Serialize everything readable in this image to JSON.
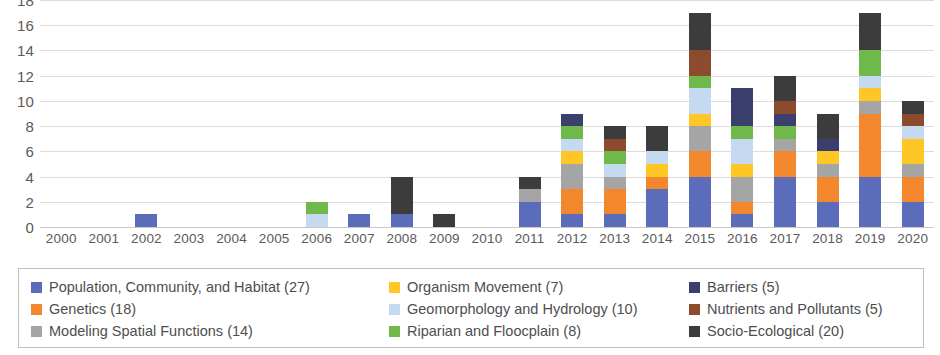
{
  "chart_data": {
    "type": "bar",
    "stacked": true,
    "title": "",
    "xlabel": "",
    "ylabel": "",
    "ylim": [
      0,
      18
    ],
    "ytick_step": 2,
    "yticks": [
      18,
      16,
      14,
      12,
      10,
      8,
      6,
      4,
      2,
      0
    ],
    "grid": true,
    "legend_position": "bottom",
    "categories": [
      "2000",
      "2001",
      "2002",
      "2003",
      "2004",
      "2005",
      "2006",
      "2007",
      "2008",
      "2009",
      "2010",
      "2011",
      "2012",
      "2013",
      "2014",
      "2015",
      "2016",
      "2017",
      "2018",
      "2019",
      "2020"
    ],
    "series": [
      {
        "name": "Population, Community, and Habitat",
        "total": 27,
        "color": "#5b6dba",
        "values": [
          0,
          0,
          1,
          0,
          0,
          0,
          0,
          1,
          1,
          0,
          0,
          2,
          1,
          1,
          3,
          4,
          1,
          4,
          2,
          4,
          2
        ]
      },
      {
        "name": "Genetics",
        "total": 18,
        "color": "#f2872e",
        "values": [
          0,
          0,
          0,
          0,
          0,
          0,
          0,
          0,
          0,
          0,
          0,
          0,
          2,
          2,
          1,
          2,
          1,
          2,
          2,
          5,
          2
        ]
      },
      {
        "name": "Modeling Spatial Functions",
        "total": 14,
        "color": "#a5a5a5",
        "values": [
          0,
          0,
          0,
          0,
          0,
          0,
          0,
          0,
          0,
          0,
          0,
          1,
          2,
          1,
          0,
          2,
          2,
          1,
          1,
          1,
          1
        ]
      },
      {
        "name": "Organism Movement",
        "total": 7,
        "color": "#ffc726",
        "values": [
          0,
          0,
          0,
          0,
          0,
          0,
          0,
          0,
          0,
          0,
          0,
          0,
          1,
          0,
          1,
          1,
          1,
          0,
          1,
          1,
          2
        ]
      },
      {
        "name": "Geomorphology and Hydrology",
        "total": 10,
        "color": "#c5d9f1",
        "values": [
          0,
          0,
          0,
          0,
          0,
          0,
          1,
          0,
          0,
          0,
          0,
          0,
          1,
          1,
          1,
          2,
          2,
          0,
          0,
          1,
          1
        ]
      },
      {
        "name": "Riparian and Floocplain",
        "total": 8,
        "color": "#6eb94a",
        "values": [
          0,
          0,
          0,
          0,
          0,
          0,
          1,
          0,
          0,
          0,
          0,
          0,
          1,
          1,
          0,
          1,
          1,
          1,
          0,
          2,
          0
        ]
      },
      {
        "name": "Barriers",
        "total": 5,
        "color": "#3b3f6e",
        "values": [
          0,
          0,
          0,
          0,
          0,
          0,
          0,
          0,
          0,
          0,
          0,
          0,
          1,
          0,
          0,
          0,
          3,
          1,
          1,
          0,
          0
        ]
      },
      {
        "name": "Nutrients and Pollutants",
        "total": 5,
        "color": "#8c4b2c",
        "values": [
          0,
          0,
          0,
          0,
          0,
          0,
          0,
          0,
          0,
          0,
          0,
          0,
          0,
          1,
          0,
          2,
          0,
          1,
          0,
          0,
          1
        ]
      },
      {
        "name": "Socio-Ecological",
        "total": 20,
        "color": "#3c3c3c",
        "values": [
          0,
          0,
          0,
          0,
          0,
          0,
          0,
          0,
          3,
          1,
          0,
          1,
          0,
          1,
          2,
          3,
          0,
          2,
          2,
          3,
          1
        ]
      }
    ],
    "totals": [
      0,
      0,
      1,
      0,
      0,
      0,
      2,
      1,
      4,
      1,
      0,
      4,
      9,
      8,
      8,
      17,
      11,
      12,
      9,
      17,
      10
    ]
  },
  "legend": {
    "entries": [
      {
        "label": "Population, Community, and Habitat (27)",
        "color": "#5b6dba"
      },
      {
        "label": "Genetics (18)",
        "color": "#f2872e"
      },
      {
        "label": "Modeling Spatial Functions (14)",
        "color": "#a5a5a5"
      },
      {
        "label": "Organism Movement (7)",
        "color": "#ffc726"
      },
      {
        "label": "Geomorphology and Hydrology (10)",
        "color": "#c5d9f1"
      },
      {
        "label": "Riparian and Floocplain (8)",
        "color": "#6eb94a"
      },
      {
        "label": "Barriers (5)",
        "color": "#3b3f6e"
      },
      {
        "label": "Nutrients and Pollutants (5)",
        "color": "#8c4b2c"
      },
      {
        "label": "Socio-Ecological (20)",
        "color": "#3c3c3c"
      }
    ]
  }
}
